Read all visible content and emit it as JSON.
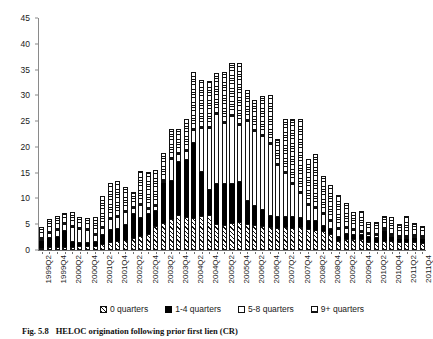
{
  "caption": {
    "number": "Fig. 5.8",
    "text": "HELOC origination following prior first lien (CR)"
  },
  "chart_data": {
    "type": "bar",
    "stacked": true,
    "title": "",
    "xlabel": "",
    "ylabel": "",
    "ylim": [
      0,
      45
    ],
    "ytick_step": 5,
    "yticks": [
      0,
      5,
      10,
      15,
      20,
      25,
      30,
      35,
      40,
      45
    ],
    "grid": false,
    "legend_position": "bottom",
    "categories": [
      "1999Q2",
      "1999Q3",
      "1999Q4",
      "2000Q1",
      "2000Q2",
      "2000Q3",
      "2000Q4",
      "2001Q1",
      "2001Q2",
      "2001Q3",
      "2001Q4",
      "2002Q1",
      "2002Q2",
      "2002Q3",
      "2002Q4",
      "2003Q1",
      "2003Q2",
      "2003Q3",
      "2003Q4",
      "2004Q1",
      "2004Q2",
      "2004Q3",
      "2004Q4",
      "2005Q1",
      "2005Q2",
      "2005Q3",
      "2005Q4",
      "2006Q1",
      "2006Q2",
      "2006Q3",
      "2006Q4",
      "2007Q1",
      "2007Q2",
      "2007Q3",
      "2007Q4",
      "2008Q1",
      "2008Q2",
      "2008Q3",
      "2008Q4",
      "2009Q1",
      "2009Q2",
      "2009Q3",
      "2009Q4",
      "2010Q1",
      "2010Q2",
      "2010Q3",
      "2010Q4",
      "2011Q1",
      "2011Q2",
      "2011Q3",
      "2011Q4"
    ],
    "tick_labels": [
      "1999Q2",
      "",
      "1999Q4",
      "",
      "2000Q2",
      "",
      "2000Q4",
      "",
      "2001Q2",
      "",
      "2001Q4",
      "",
      "2002Q2",
      "",
      "2002Q4",
      "",
      "2003Q2",
      "",
      "2003Q4",
      "",
      "2004Q2",
      "",
      "2004Q4",
      "",
      "2005Q2",
      "",
      "2005Q4",
      "",
      "2006Q2",
      "",
      "2006Q4",
      "",
      "2007Q2",
      "",
      "2007Q4",
      "",
      "2008Q2",
      "",
      "2008Q4",
      "",
      "2009Q2",
      "",
      "2009Q4",
      "",
      "2010Q2",
      "",
      "2010Q4",
      "",
      "2011Q2",
      "",
      "2011Q4"
    ],
    "series": [
      {
        "name": "0 quarters",
        "pattern": "diagonal-hatch",
        "color": "#ffffff",
        "edge": "#111111",
        "values": [
          0.3,
          0.5,
          0.6,
          0.6,
          0.6,
          0.7,
          0.7,
          0.8,
          1.1,
          1.5,
          1.8,
          2.0,
          2.3,
          2.8,
          3.2,
          4.6,
          5.3,
          6.1,
          6.7,
          6.4,
          6.2,
          6.6,
          6.7,
          5.0,
          4.9,
          5.2,
          5.4,
          5.0,
          4.8,
          4.6,
          4.5,
          4.3,
          4.4,
          4.3,
          4.4,
          4.0,
          3.9,
          3.6,
          3.1,
          1.8,
          2.1,
          2.2,
          2.1,
          1.6,
          1.6,
          1.7,
          1.7,
          1.5,
          1.5,
          1.5,
          1.4
        ]
      },
      {
        "name": "1-4 quarters",
        "pattern": "solid-black",
        "color": "#000000",
        "edge": "#000000",
        "values": [
          1.3,
          1.9,
          1.9,
          3.0,
          0.9,
          0.7,
          0.6,
          0.7,
          1.9,
          2.3,
          2.3,
          2.9,
          4.7,
          3.4,
          3.7,
          3.0,
          7.7,
          7.2,
          10.3,
          11.0,
          14.5,
          8.5,
          5.0,
          7.9,
          8.0,
          7.6,
          7.8,
          4.5,
          3.8,
          3.2,
          2.1,
          2.2,
          2.1,
          2.2,
          1.8,
          1.6,
          1.7,
          1.1,
          1.0,
          0.8,
          1.1,
          0.8,
          0.8,
          1.0,
          0.8,
          1.9,
          0.8,
          0.7,
          0.7,
          0.8,
          0.8
        ]
      },
      {
        "name": "5-8 quarters",
        "pattern": "white",
        "color": "#ffffff",
        "edge": "#111111",
        "values": [
          0.5,
          1.0,
          1.4,
          1.5,
          3.0,
          2.7,
          2.6,
          1.4,
          1.2,
          2.2,
          2.3,
          2.4,
          1.1,
          2.5,
          1.0,
          1.0,
          0.3,
          4.3,
          1.6,
          1.8,
          2.5,
          8.5,
          12.0,
          13.4,
          11.8,
          13.2,
          11.1,
          15.5,
          14.5,
          14.4,
          14.0,
          10.0,
          8.5,
          6.4,
          4.9,
          3.1,
          2.5,
          2.2,
          1.5,
          1.5,
          1.1,
          0.8,
          0.6,
          0.6,
          0.5,
          0.5,
          0.5,
          0.4,
          0.4,
          0.4,
          0.4
        ]
      },
      {
        "name": "9+ quarters",
        "pattern": "horizontal-stripes",
        "color": "#ffffff",
        "edge": "#111111",
        "values": [
          2.3,
          2.7,
          2.8,
          2.1,
          2.8,
          2.3,
          2.4,
          3.5,
          6.3,
          7.0,
          6.9,
          5.0,
          3.1,
          6.6,
          7.2,
          7.0,
          5.5,
          5.9,
          4.8,
          6.2,
          11.4,
          9.4,
          9.0,
          8.0,
          9.9,
          10.2,
          11.9,
          6.1,
          6.1,
          7.6,
          9.4,
          5.1,
          10.5,
          12.6,
          14.3,
          9.0,
          10.5,
          7.4,
          7.0,
          6.6,
          4.9,
          3.5,
          4.0,
          2.3,
          2.6,
          2.6,
          3.4,
          2.4,
          4.1,
          2.5,
          2.1
        ]
      }
    ]
  },
  "legend": {
    "items": [
      {
        "label": "0 quarters",
        "swatch": "diagonal-hatch-swatch"
      },
      {
        "label": "1-4 quarters",
        "swatch": "solid-black-swatch"
      },
      {
        "label": "5-8 quarters",
        "swatch": "white-swatch"
      },
      {
        "label": "9+ quarters",
        "swatch": "horizontal-stripes-swatch"
      }
    ]
  }
}
